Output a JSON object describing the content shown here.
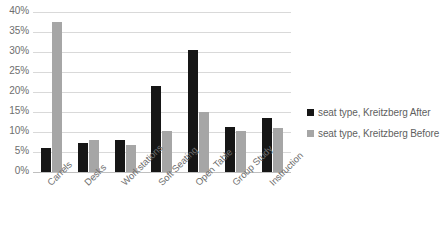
{
  "chart_data": {
    "type": "bar",
    "title": "",
    "subtitle": "",
    "xlabel": "",
    "ylabel": "",
    "categories": [
      "Carrels",
      "Desks",
      "Workstations",
      "Soft Seating",
      "Open Table",
      "Group Study",
      "Instruction"
    ],
    "series": [
      {
        "name": "seat type, Kreitzberg After",
        "color": "#161616",
        "values": [
          6.0,
          7.3,
          8.0,
          21.5,
          30.5,
          11.3,
          13.5
        ]
      },
      {
        "name": "seat type, Kreitzberg Before",
        "color": "#a6a6a6",
        "values": [
          37.5,
          8.0,
          6.8,
          10.3,
          15.0,
          10.3,
          11.0
        ]
      }
    ],
    "ylim": [
      0,
      40
    ],
    "ytick_values": [
      0,
      5,
      10,
      15,
      20,
      25,
      30,
      35,
      40
    ],
    "ytick_labels": [
      "0%",
      "5%",
      "10%",
      "15%",
      "20%",
      "25%",
      "30%",
      "35%",
      "40%"
    ],
    "grid": true,
    "grid_color": "#d9d9d9",
    "legend_position": "right",
    "axis_text_color": "#6e6e6e",
    "background": "#ffffff"
  },
  "legend": {
    "entries": [
      {
        "label": "seat type, Kreitzberg After",
        "swatch": "#161616",
        "icon": "legend-square-icon"
      },
      {
        "label": "seat type, Kreitzberg Before",
        "swatch": "#a6a6a6",
        "icon": "legend-square-icon"
      }
    ]
  }
}
